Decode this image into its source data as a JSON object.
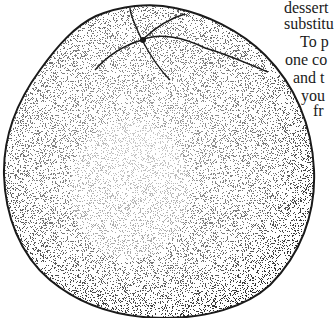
{
  "illustration": {
    "subject": "stippled pen-and-ink drawing of an orange (citrus fruit), top view",
    "ink_color": "#1a1a1a",
    "paper_color": "#ffffff"
  },
  "text_fragment": {
    "lines": [
      {
        "text": "dessert",
        "x": 284,
        "y": 0
      },
      {
        "text": "substitu",
        "x": 284,
        "y": 16
      },
      {
        "text": "To p",
        "x": 300,
        "y": 34
      },
      {
        "text": "one co",
        "x": 285,
        "y": 52
      },
      {
        "text": "and t",
        "x": 293,
        "y": 70
      },
      {
        "text": "you",
        "x": 301,
        "y": 88
      },
      {
        "text": "fr",
        "x": 313,
        "y": 103
      }
    ]
  }
}
